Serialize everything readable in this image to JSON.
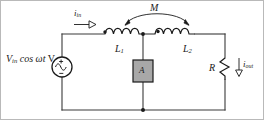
{
  "figure": {
    "type": "circuit-diagram",
    "background_color": "#ffffff",
    "wire_color": "#3a3a3a",
    "ink_color": "#1a1a1a",
    "box_fill_color": "#a8a8a8",
    "box_stroke_color": "#1a1a1a"
  },
  "labels": {
    "source": {
      "value_symbol": "V",
      "value_subscript": "in",
      "expression": " cos ωt",
      "unit": " V",
      "full_text": "V_in cos ωt V"
    },
    "input_current": {
      "symbol": "i",
      "subscript": "in",
      "full_text": "i_in"
    },
    "mutual_inductance": {
      "symbol": "M",
      "full_text": "M"
    },
    "inductor_1": {
      "symbol": "L",
      "subscript": "1",
      "full_text": "L_1"
    },
    "inductor_2": {
      "symbol": "L",
      "subscript": "2",
      "full_text": "L_2"
    },
    "resistor": {
      "symbol": "R",
      "full_text": "R"
    },
    "output_current": {
      "symbol": "i",
      "subscript": "out",
      "full_text": "i_out"
    },
    "ammeter": {
      "symbol": "A",
      "full_text": "A"
    }
  },
  "components": {
    "voltage_source": {
      "name": "ac-voltage-source",
      "polarity_top": "+",
      "polarity_bottom": "−",
      "waveform": "sine"
    },
    "coil_1": {
      "name": "inductor-L1",
      "bumps": 4,
      "dot_marking": "top-left"
    },
    "coil_2": {
      "name": "inductor-L2",
      "bumps": 4,
      "dot_marking": "top-left"
    },
    "ammeter_box": {
      "name": "ammeter-block",
      "shape": "square",
      "shaded": true
    },
    "load_resistor": {
      "name": "resistor-R",
      "style": "zigzag"
    },
    "coupling_arc": {
      "name": "mutual-coupling-arc",
      "arrowheads": "both"
    },
    "input_arrow": {
      "name": "input-current-arrow",
      "direction": "right",
      "fill": "hollow"
    },
    "output_arrow": {
      "name": "output-current-arrow",
      "direction": "down",
      "fill": "hollow"
    }
  }
}
